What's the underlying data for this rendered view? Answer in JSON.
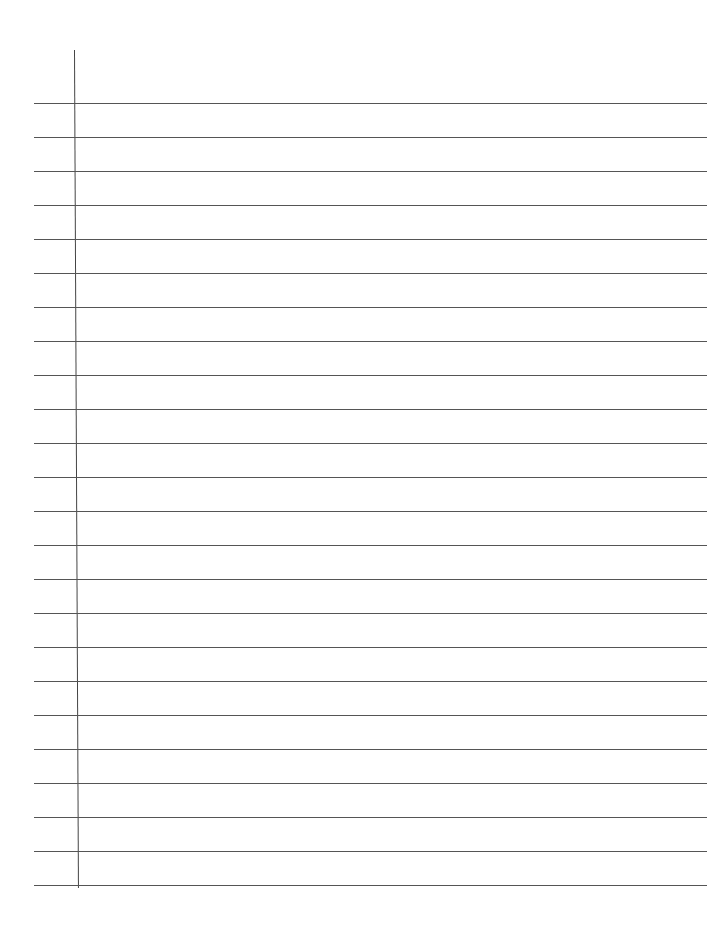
{
  "paper": {
    "type": "lined-notebook-page",
    "line_count": 24,
    "first_line_y": 103,
    "line_spacing": 34,
    "line_color": "#555555",
    "margin_line_color": "#444444",
    "background": "#ffffff"
  }
}
